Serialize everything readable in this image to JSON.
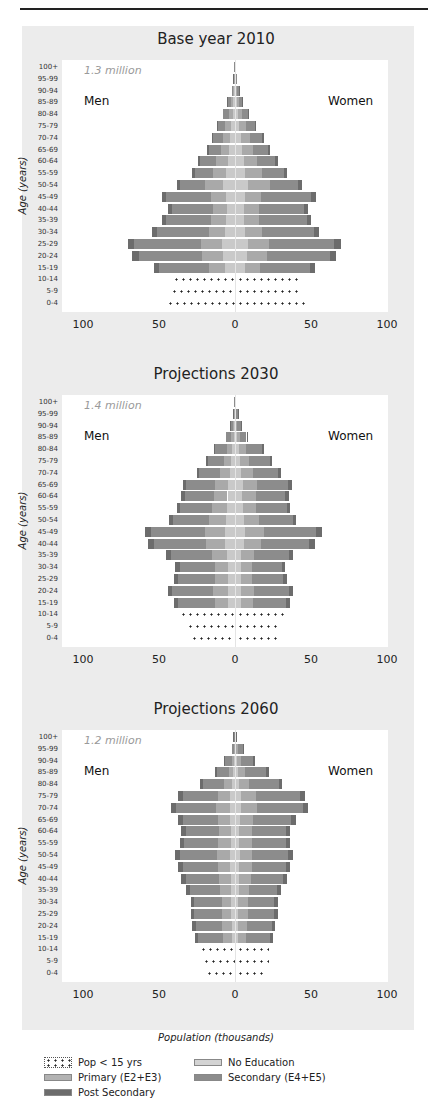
{
  "header": {
    "caption": ""
  },
  "colors": {
    "post_secondary": "#6c6c6c",
    "secondary": "#8c8c8c",
    "primary": "#a9a9a9",
    "no_education": "#c9c9c9",
    "background": "#ececec"
  },
  "labels": {
    "men": "Men",
    "women": "Women",
    "ylabel": "Age (years)",
    "xlabel": "Population (thousands)",
    "ticks": [
      "100",
      "50",
      "0",
      "50",
      "100"
    ]
  },
  "legend": {
    "items": [
      {
        "label": "Pop < 15 yrs",
        "key": "pop_under_15"
      },
      {
        "label": "No Education",
        "key": "no_education"
      },
      {
        "label": "Primary (E2+E3)",
        "key": "primary"
      },
      {
        "label": "Secondary (E4+E5)",
        "key": "secondary"
      },
      {
        "label": "Post Secondary",
        "key": "post_secondary"
      }
    ]
  },
  "panels": [
    {
      "title": "Base year 2010",
      "total": "1.3 million"
    },
    {
      "title": "Projections 2030",
      "total": "1.4 million"
    },
    {
      "title": "Projections 2060",
      "total": "1.2 million"
    }
  ],
  "chart_data": [
    {
      "type": "bar",
      "title": "Base year 2010",
      "annotation": "1.3 million",
      "xlabel": "Population (thousands)",
      "ylabel": "Age (years)",
      "xlim": [
        -100,
        100
      ],
      "categories": [
        "100+",
        "95-99",
        "90-94",
        "85-89",
        "80-84",
        "75-79",
        "70-74",
        "65-69",
        "60-64",
        "55-59",
        "50-54",
        "45-49",
        "40-44",
        "35-39",
        "30-34",
        "25-29",
        "20-24",
        "15-19",
        "10-14",
        "5-9",
        "0-4"
      ],
      "series": [
        {
          "name": "Men",
          "values": [
            0.5,
            1,
            2,
            5,
            8,
            12,
            15,
            18,
            24,
            28,
            38,
            48,
            44,
            48,
            54,
            70,
            67,
            53,
            42,
            43,
            46
          ]
        },
        {
          "name": "Women",
          "values": [
            0.5,
            1,
            3,
            5,
            9,
            14,
            19,
            23,
            28,
            34,
            44,
            53,
            48,
            50,
            55,
            69,
            66,
            52,
            42,
            43,
            46
          ]
        }
      ]
    },
    {
      "type": "bar",
      "title": "Projections 2030",
      "annotation": "1.4 million",
      "xlabel": "Population (thousands)",
      "ylabel": "Age (years)",
      "xlim": [
        -100,
        100
      ],
      "categories": [
        "100+",
        "95-99",
        "90-94",
        "85-89",
        "80-84",
        "75-79",
        "70-74",
        "65-69",
        "60-64",
        "55-59",
        "50-54",
        "45-49",
        "40-44",
        "35-39",
        "30-34",
        "25-29",
        "20-24",
        "15-19",
        "10-14",
        "5-9",
        "0-4"
      ],
      "series": [
        {
          "name": "Men",
          "values": [
            0.5,
            1,
            3,
            6,
            14,
            19,
            25,
            34,
            35,
            38,
            43,
            59,
            57,
            45,
            39,
            40,
            44,
            40,
            37,
            33,
            30
          ]
        },
        {
          "name": "Women",
          "values": [
            0.5,
            2,
            4,
            8,
            19,
            24,
            30,
            37,
            35,
            36,
            40,
            57,
            52,
            38,
            33,
            34,
            38,
            36,
            32,
            30,
            28
          ]
        }
      ]
    },
    {
      "type": "bar",
      "title": "Projections 2060",
      "annotation": "1.2 million",
      "xlabel": "Population (thousands)",
      "ylabel": "Age (years)",
      "xlim": [
        -100,
        100
      ],
      "categories": [
        "100+",
        "95-99",
        "90-94",
        "85-89",
        "80-84",
        "75-79",
        "70-74",
        "65-69",
        "60-64",
        "55-59",
        "50-54",
        "45-49",
        "40-44",
        "35-39",
        "30-34",
        "25-29",
        "20-24",
        "15-19",
        "10-14",
        "5-9",
        "0-4"
      ],
      "series": [
        {
          "name": "Men",
          "values": [
            1,
            2,
            7,
            13,
            23,
            37,
            42,
            37,
            35,
            36,
            39,
            37,
            35,
            32,
            29,
            29,
            28,
            26,
            24,
            22,
            20
          ]
        },
        {
          "name": "Women",
          "values": [
            1,
            6,
            13,
            22,
            31,
            46,
            48,
            40,
            36,
            36,
            38,
            36,
            34,
            30,
            28,
            28,
            26,
            25,
            22,
            22,
            20
          ]
        }
      ]
    }
  ]
}
